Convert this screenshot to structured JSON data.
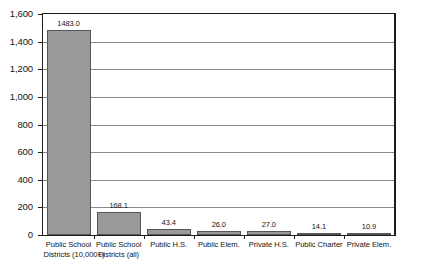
{
  "chart_data": {
    "type": "bar",
    "title": "",
    "subtitle": "",
    "xlabel": "",
    "ylabel": "",
    "ylim": [
      0,
      1600
    ],
    "ytick_step": 200,
    "grid": true,
    "legend": false,
    "legend_position": "none",
    "bar_color": "#9a9a9a",
    "bar_outline_color": "#565656",
    "gridline_color": "#8a8a8a",
    "axis_color": "#1d1d1d",
    "categories": [
      "Public School Districts (10,000+)",
      "Public School Districts (all)",
      "Public H.S.",
      "Public Elem.",
      "Private H.S.",
      "Public Charter",
      "Private Elem."
    ],
    "category_lines": [
      [
        "Public School",
        "Districts (10,000+)"
      ],
      [
        "Public School",
        "Districts (all)"
      ],
      [
        "Public H.S."
      ],
      [
        "Public Elem."
      ],
      [
        "Private H.S."
      ],
      [
        "Public Charter"
      ],
      [
        "Private Elem."
      ]
    ],
    "values": [
      1483.0,
      168.1,
      43.4,
      26.0,
      27.0,
      14.1,
      10.9
    ],
    "value_labels": [
      "1483.0",
      "168.1",
      "43.4",
      "26.0",
      "27.0",
      "14.1",
      "10.9"
    ],
    "ytick_labels": [
      "1,600",
      "1,400",
      "1,200",
      "1,000",
      "800",
      "600",
      "400",
      "200",
      "0"
    ],
    "ytick_values": [
      1600,
      1400,
      1200,
      1000,
      800,
      600,
      400,
      200,
      0
    ]
  }
}
